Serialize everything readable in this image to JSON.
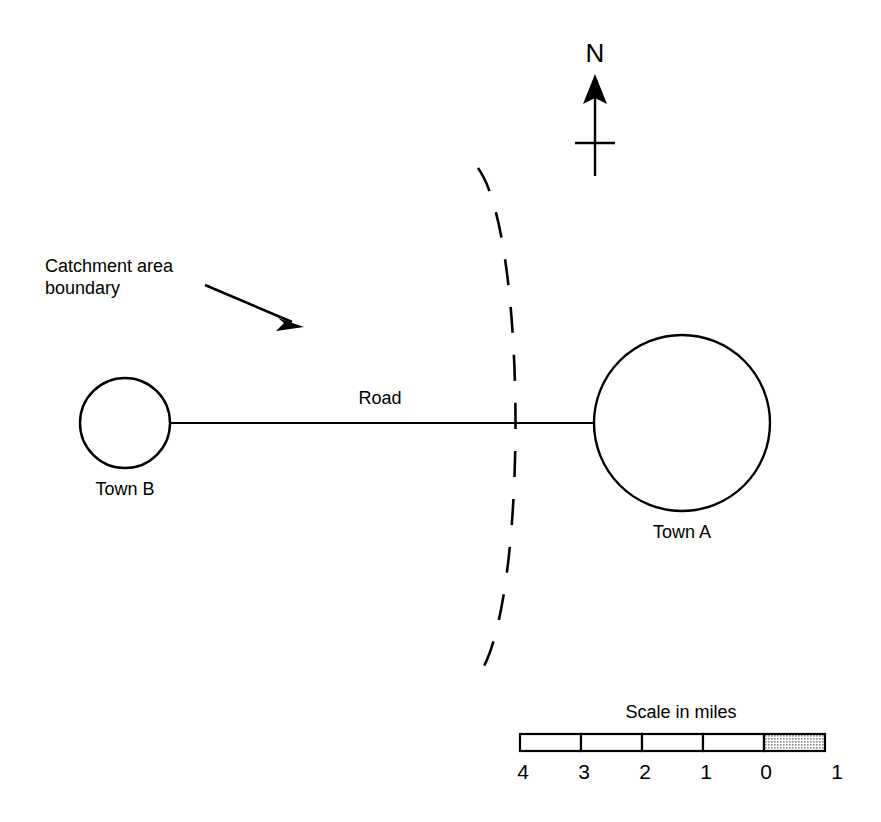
{
  "figure": {
    "type": "map-diagram",
    "background_color": "#ffffff",
    "line_color": "#000000",
    "width": 881,
    "height": 822
  },
  "compass": {
    "label": "N",
    "icon": "north-arrow-icon",
    "x": 595,
    "label_y": 62,
    "shaft_top": 80,
    "shaft_bottom": 175,
    "crossbar_y": 143
  },
  "towns": [
    {
      "id": "town-b",
      "label": "Town B",
      "cx": 125,
      "cy": 423,
      "r": 45,
      "label_x": 125,
      "label_y": 495
    },
    {
      "id": "town-a",
      "label": "Town A",
      "cx": 682,
      "cy": 423,
      "r": 88,
      "label_x": 682,
      "label_y": 538
    }
  ],
  "road": {
    "label": "Road",
    "label_x": 380,
    "label_y": 404,
    "y": 423,
    "x_start": 170,
    "x_end": 594
  },
  "catchment": {
    "annotation_line1": "Catchment area",
    "annotation_line2": "boundary",
    "annotation_x": 45,
    "annotation_y1": 272,
    "annotation_y2": 294,
    "leader_from_x": 205,
    "leader_from_y": 285,
    "leader_to_x": 302,
    "leader_to_y": 326,
    "arc_path": "M 478 168 C 540 250 540 590 478 676",
    "crossing_x": 297,
    "crossing_y": 423
  },
  "scale_bar": {
    "title": "Scale in miles",
    "title_x": 681,
    "title_y": 718,
    "bar_x": 520,
    "bar_y": 734,
    "bar_width": 305,
    "bar_height": 17,
    "segment_count": 5,
    "shaded_segment_index": 4,
    "shaded_fill": "#c9c9c9",
    "unshaded_fill": "#ffffff",
    "tick_label_y": 779,
    "ticks": [
      {
        "label": "4",
        "x": 523
      },
      {
        "label": "3",
        "x": 584
      },
      {
        "label": "2",
        "x": 645
      },
      {
        "label": "1",
        "x": 706
      },
      {
        "label": "0",
        "x": 766
      },
      {
        "label": "1",
        "x": 837
      }
    ]
  }
}
